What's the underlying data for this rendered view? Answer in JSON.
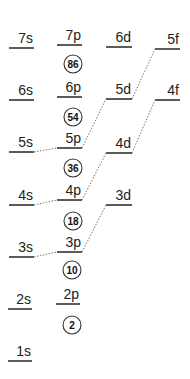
{
  "diagram": {
    "type": "orbital-energy-levels",
    "levels": [
      {
        "label": "7s",
        "x1": 9,
        "x2": 34,
        "y": 48
      },
      {
        "label": "7p",
        "x1": 57,
        "x2": 82,
        "y": 45
      },
      {
        "label": "6d",
        "x1": 106,
        "x2": 132,
        "y": 47
      },
      {
        "label": "5f",
        "x1": 155,
        "x2": 180,
        "y": 49
      },
      {
        "label": "6s",
        "x1": 9,
        "x2": 34,
        "y": 100
      },
      {
        "label": "6p",
        "x1": 57,
        "x2": 82,
        "y": 97
      },
      {
        "label": "5d",
        "x1": 106,
        "x2": 132,
        "y": 99
      },
      {
        "label": "4f",
        "x1": 155,
        "x2": 180,
        "y": 100
      },
      {
        "label": "5s",
        "x1": 9,
        "x2": 34,
        "y": 152
      },
      {
        "label": "5p",
        "x1": 57,
        "x2": 82,
        "y": 148
      },
      {
        "label": "4d",
        "x1": 106,
        "x2": 132,
        "y": 153
      },
      {
        "label": "4s",
        "x1": 9,
        "x2": 34,
        "y": 205
      },
      {
        "label": "4p",
        "x1": 57,
        "x2": 82,
        "y": 200
      },
      {
        "label": "3d",
        "x1": 106,
        "x2": 132,
        "y": 205
      },
      {
        "label": "3s",
        "x1": 9,
        "x2": 34,
        "y": 257
      },
      {
        "label": "3p",
        "x1": 57,
        "x2": 82,
        "y": 252
      },
      {
        "label": "2s",
        "x1": 8,
        "x2": 32,
        "y": 309
      },
      {
        "label": "2p",
        "x1": 56,
        "x2": 80,
        "y": 304
      },
      {
        "label": "1s",
        "x1": 8,
        "x2": 32,
        "y": 361
      }
    ],
    "shell_closures": [
      {
        "value": "86",
        "cx": 73,
        "cy": 64
      },
      {
        "value": "54",
        "cx": 73,
        "cy": 117
      },
      {
        "value": "36",
        "cx": 73,
        "cy": 168
      },
      {
        "value": "18",
        "cx": 73,
        "cy": 221
      },
      {
        "value": "10",
        "cx": 72,
        "cy": 270
      },
      {
        "value": "2",
        "cx": 72,
        "cy": 325
      }
    ],
    "connectors": [
      {
        "from": "3s",
        "to": "3p"
      },
      {
        "from": "3p",
        "to": "3d"
      },
      {
        "from": "4s",
        "to": "4p"
      },
      {
        "from": "4p",
        "to": "4d"
      },
      {
        "from": "4d",
        "to": "4f"
      },
      {
        "from": "5s",
        "to": "5p"
      },
      {
        "from": "5p",
        "to": "5d"
      },
      {
        "from": "5d",
        "to": "5f"
      }
    ]
  }
}
